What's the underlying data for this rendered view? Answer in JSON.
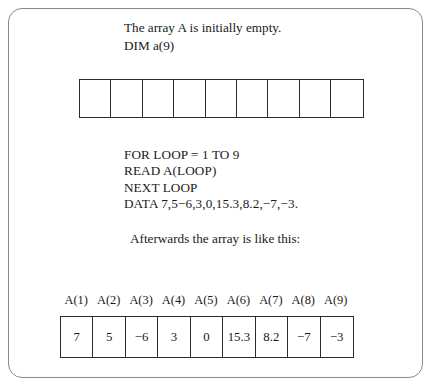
{
  "figure": {
    "intro": {
      "line1": "The array A is initially empty.",
      "line2": "DIM a(9)"
    },
    "empty_array": {
      "cell_count": 9,
      "cells": [
        "",
        "",
        "",
        "",
        "",
        "",
        "",
        "",
        ""
      ]
    },
    "code": {
      "line1": "FOR LOOP = 1 TO 9",
      "line2": "READ A(LOOP)",
      "line3": "NEXT LOOP",
      "line4": "DATA 7,5−6,3,0,15.3,8.2,−7,−3."
    },
    "afterwards_label": "Afterwards the array is like this:",
    "index_labels": [
      "A(1)",
      "A(2)",
      "A(3)",
      "A(4)",
      "A(5)",
      "A(6)",
      "A(7)",
      "A(8)",
      "A(9)"
    ],
    "filled_values": [
      "7",
      "5",
      "−6",
      "3",
      "0",
      "15.3",
      "8.2",
      "−7",
      "−3"
    ],
    "colors": {
      "frame_border": "#8a8a8a",
      "table_border": "#2b2b2b",
      "text": "#1a1a1a",
      "background": "#ffffff"
    }
  }
}
